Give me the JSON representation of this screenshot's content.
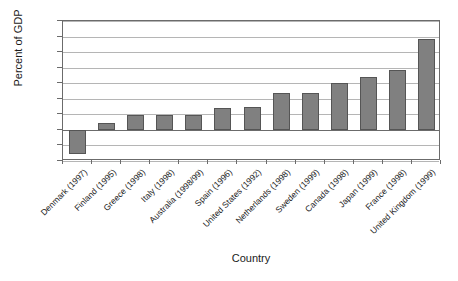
{
  "chart_data": {
    "type": "bar",
    "title": "",
    "xlabel": "Country",
    "ylabel": "Percent of GDP",
    "ylim": [
      -0.4,
      1.4
    ],
    "yticks": [
      -0.4,
      -0.2,
      0,
      0.2,
      0.4,
      0.6,
      0.8,
      1,
      1.2,
      1.4
    ],
    "ytick_labels": [
      "-0.4",
      "-0.2",
      "0",
      "0.2",
      "0.4",
      "0.6",
      "0.8",
      "1",
      "1.2",
      "1.4"
    ],
    "grid": true,
    "legend": "none",
    "bar_color": "#808080",
    "bar_border_color": "#555555",
    "categories": [
      "Denmark (1997)",
      "Finland (1995)",
      "Greece (1998)",
      "Italy (1998)",
      "Australia (1998/99)",
      "Spain (1996)",
      "United States (1992)",
      "Netherlands (1998)",
      "Sweden (1999)",
      "Canada (1998)",
      "Japan (1999)",
      "France (1998)",
      "United Kingdom (1999)"
    ],
    "values": [
      -0.31,
      0.09,
      0.19,
      0.19,
      0.19,
      0.28,
      0.29,
      0.48,
      0.48,
      0.6,
      0.68,
      0.77,
      1.17
    ]
  }
}
